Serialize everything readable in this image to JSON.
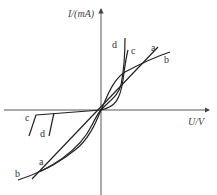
{
  "diagram": {
    "y_axis_label": "I/(mA)",
    "x_axis_label": "U/V",
    "curves": [
      {
        "id": "a",
        "label": "a",
        "description": "straight line through origin"
      },
      {
        "id": "b",
        "label": "b",
        "description": "S-shaped curve through origin, flattening at both ends"
      },
      {
        "id": "c",
        "label": "c",
        "description": "forward: steep rising curve; reverse: near-zero current then breakdown"
      },
      {
        "id": "d",
        "label": "d",
        "description": "forward: steepest rising curve; reverse: near-zero current then breakdown at lower |U|"
      }
    ],
    "labels": {
      "a_top": "a",
      "b_top": "b",
      "c_top": "c",
      "d_top": "d",
      "c_bottom": "c",
      "d_bottom": "d",
      "a_bottom": "a",
      "b_bottom": "b"
    },
    "colors": {
      "line": "#222222",
      "axis": "#444444",
      "background": "#ffffff"
    }
  }
}
